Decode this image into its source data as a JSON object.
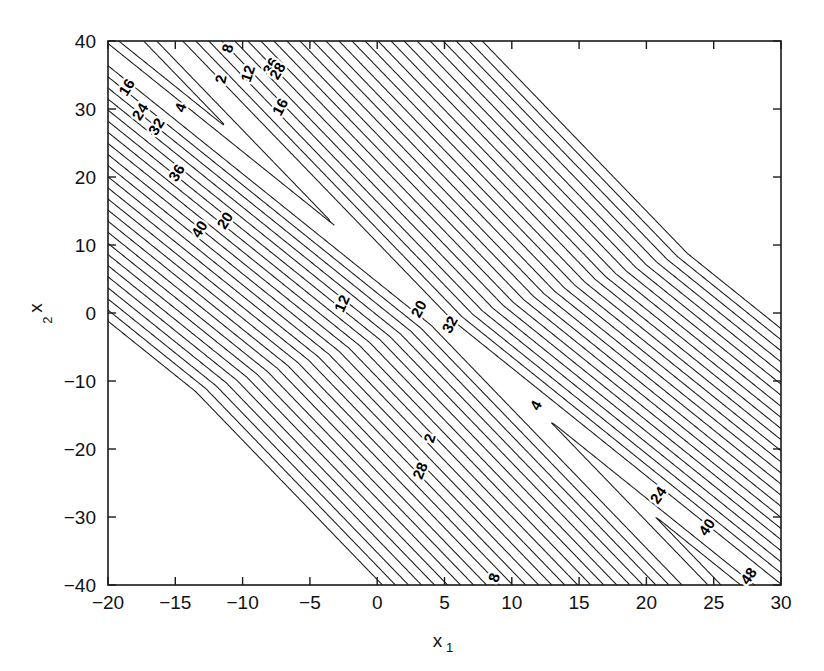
{
  "figure": {
    "background_color": "#ffffff",
    "line_color": "#1a1a1a",
    "text_color": "#111111",
    "plot_box": {
      "left": 108,
      "top": 41,
      "right": 781,
      "bottom": 585
    }
  },
  "chart_data": {
    "type": "contour",
    "title": "",
    "xlabel": "x",
    "xlabel_sub": "1",
    "ylabel": "x",
    "ylabel_sub": "2",
    "xlim": [
      -20,
      30
    ],
    "ylim": [
      -40,
      40
    ],
    "grid": false,
    "legend": "none",
    "xticks": [
      -20,
      -15,
      -10,
      -5,
      0,
      5,
      10,
      15,
      20,
      25,
      30
    ],
    "xticklabels": [
      "-20",
      "-15",
      "-10",
      "-5",
      "0",
      "5",
      "10",
      "15",
      "20",
      "25",
      "30"
    ],
    "yticks": [
      -40,
      -30,
      -20,
      -10,
      0,
      10,
      20,
      30,
      40
    ],
    "yticklabels": [
      "-40",
      "-30",
      "-20",
      "-10",
      "0",
      "10",
      "20",
      "30",
      "40"
    ],
    "tick_direction": "in",
    "levels": [
      2,
      4,
      6,
      8,
      10,
      12,
      14,
      16,
      18,
      20,
      22,
      24,
      26,
      28,
      30,
      32,
      34,
      36,
      38,
      40,
      42,
      44,
      46,
      48
    ],
    "level_step": 2,
    "labeled_levels": [
      2,
      4,
      8,
      12,
      16,
      20,
      24,
      28,
      32,
      36,
      40,
      48
    ],
    "contour_labels": [
      {
        "text": "16",
        "x": -18.6,
        "y": 33.2,
        "rot": -58
      },
      {
        "text": "24",
        "x": -17.6,
        "y": 29.6,
        "rot": -58
      },
      {
        "text": "32",
        "x": -16.4,
        "y": 27.4,
        "rot": -58
      },
      {
        "text": "36",
        "x": -14.9,
        "y": 20.6,
        "rot": -58
      },
      {
        "text": "40",
        "x": -13.2,
        "y": 12.3,
        "rot": -58
      },
      {
        "text": "20",
        "x": -11.3,
        "y": 13.6,
        "rot": -58
      },
      {
        "text": "4",
        "x": -14.6,
        "y": 30.2,
        "rot": -70
      },
      {
        "text": "2",
        "x": -11.6,
        "y": 34.4,
        "rot": -78
      },
      {
        "text": "8",
        "x": -11.1,
        "y": 38.9,
        "rot": -75
      },
      {
        "text": "12",
        "x": -9.6,
        "y": 35.2,
        "rot": -72
      },
      {
        "text": "36",
        "x": -7.9,
        "y": 36.3,
        "rot": -60
      },
      {
        "text": "28",
        "x": -7.4,
        "y": 35.6,
        "rot": -60
      },
      {
        "text": "16",
        "x": -7.2,
        "y": 30.3,
        "rot": -62
      },
      {
        "text": "12",
        "x": -2.6,
        "y": 1.4,
        "rot": -66
      },
      {
        "text": "20",
        "x": 3.1,
        "y": 0.6,
        "rot": -62
      },
      {
        "text": "32",
        "x": 5.4,
        "y": -1.7,
        "rot": -62
      },
      {
        "text": "4",
        "x": 11.8,
        "y": -13.6,
        "rot": -62
      },
      {
        "text": "2",
        "x": 3.9,
        "y": -18.4,
        "rot": -72
      },
      {
        "text": "28",
        "x": 3.2,
        "y": -23.2,
        "rot": -68
      },
      {
        "text": "8",
        "x": 8.7,
        "y": -38.9,
        "rot": -70
      },
      {
        "text": "24",
        "x": 20.9,
        "y": -26.8,
        "rot": -55
      },
      {
        "text": "40",
        "x": 24.5,
        "y": -31.5,
        "rot": -55
      },
      {
        "text": "48",
        "x": 27.6,
        "y": -38.7,
        "rot": -55
      }
    ]
  }
}
